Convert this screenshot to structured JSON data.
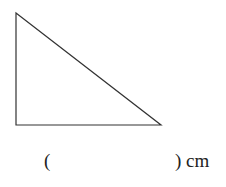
{
  "figure": {
    "shape": "right-triangle",
    "vertices": [
      [
        16,
        13
      ],
      [
        16,
        125
      ],
      [
        161,
        125
      ]
    ],
    "stroke_color": "#333333"
  },
  "answer": {
    "open_paren": "(",
    "close_label": ") cm"
  }
}
